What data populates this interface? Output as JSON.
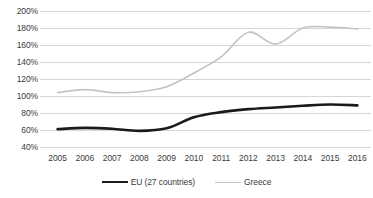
{
  "chart_data": {
    "type": "line",
    "title": "",
    "subtitle": "",
    "xlabel": "",
    "ylabel": "",
    "categories": [
      "2005",
      "2006",
      "2007",
      "2008",
      "2009",
      "2010",
      "2011",
      "2012",
      "2013",
      "2014",
      "2015",
      "2016"
    ],
    "ytick_labels": [
      "200%",
      "180%",
      "160%",
      "140%",
      "120%",
      "100%",
      "80%",
      "60%",
      "40%"
    ],
    "ytick_values": [
      200,
      180,
      160,
      140,
      120,
      100,
      80,
      60,
      40
    ],
    "ylim": [
      40,
      200
    ],
    "yunit": "%",
    "grid": true,
    "grid_axis": "y",
    "legend_position": "bottom",
    "series": [
      {
        "name": "EU (27 countries)",
        "color": "#1a1a1a",
        "width": 2.6,
        "values": [
          61,
          62.5,
          61.5,
          59,
          62,
          75,
          81,
          84.5,
          86.5,
          88.5,
          90,
          89
        ]
      },
      {
        "name": "Greece",
        "color": "#c3c3c3",
        "width": 1.6,
        "values": [
          104,
          107.5,
          104,
          105,
          111,
          127,
          146,
          175,
          161,
          180,
          181,
          179
        ]
      }
    ]
  },
  "legend": {
    "entries": [
      {
        "label": "EU (27 countries)",
        "swatch": "eu"
      },
      {
        "label": "Greece",
        "swatch": "greece"
      }
    ]
  },
  "colors": {
    "grid": "#d6d6d6",
    "text": "#3b3b3b",
    "eu": "#1a1a1a",
    "greece": "#c3c3c3",
    "background": "#ffffff"
  }
}
